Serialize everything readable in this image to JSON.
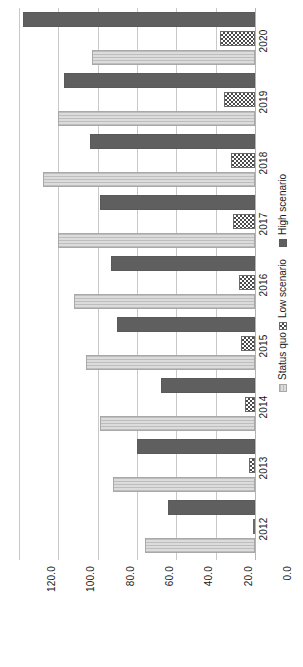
{
  "chart_data": {
    "type": "bar",
    "orientation": "horizontal",
    "rotated_page": true,
    "title": "",
    "subtitle": "",
    "xlabel": "",
    "ylabel": "",
    "categories": [
      "2012",
      "2013",
      "2014",
      "2015",
      "2016",
      "2017",
      "2018",
      "2019",
      "2020"
    ],
    "series": [
      {
        "name": "Status quo",
        "values": [
          56.0,
          72.0,
          79.0,
          86.0,
          92.0,
          100.0,
          108.0,
          100.0,
          83.0
        ]
      },
      {
        "name": "Low scenario",
        "values": [
          0.0,
          3.0,
          5.0,
          7.0,
          8.0,
          11.0,
          12.0,
          16.0,
          18.0
        ]
      },
      {
        "name": "High scenario",
        "values": [
          44.0,
          60.0,
          48.0,
          70.0,
          73.0,
          79.0,
          84.0,
          97.0,
          118.0
        ]
      }
    ],
    "value_ticks": [
      "120.0",
      "100.0",
      "80.0",
      "60.0",
      "40.0",
      "20.0",
      "0.0"
    ],
    "value_tick_numbers": [
      120.0,
      100.0,
      80.0,
      60.0,
      40.0,
      20.0,
      0.0
    ],
    "xlim": [
      0.0,
      120.0
    ],
    "grid": true,
    "grid_axis": "value",
    "legend_position": "right",
    "legend": [
      "Status quo",
      "Low scenario",
      "High scenario"
    ],
    "colors": {
      "status_quo": "#d2d2d2",
      "low_scenario": "#4a4a4a",
      "high_scenario": "#5f5f5f",
      "gridline": "#c9c9c9",
      "background": "#ffffff",
      "text": "#1a1a1a"
    }
  }
}
